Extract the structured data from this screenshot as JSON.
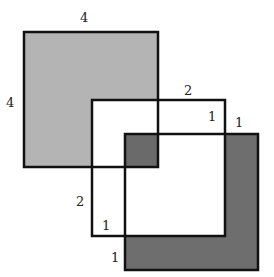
{
  "diagram": {
    "squares": [
      {
        "name": "large-square",
        "side": "4",
        "fill": "#b4b4b4"
      },
      {
        "name": "middle-square",
        "fill": "#ffffff"
      },
      {
        "name": "small-square",
        "fill": "#6e6e6e"
      }
    ],
    "labels": {
      "top_large": "4",
      "left_large": "4",
      "top_middle": "2",
      "inner_middle_right": "1",
      "outer_small_right": "1",
      "left_middle": "2",
      "inner_middle_bottom": "1",
      "outer_small_bottom": "1"
    },
    "colors": {
      "light_gray": "#b4b4b4",
      "dark_gray": "#6e6e6e",
      "overlap_gray": "#6a6a6a",
      "stroke": "#111111"
    }
  }
}
